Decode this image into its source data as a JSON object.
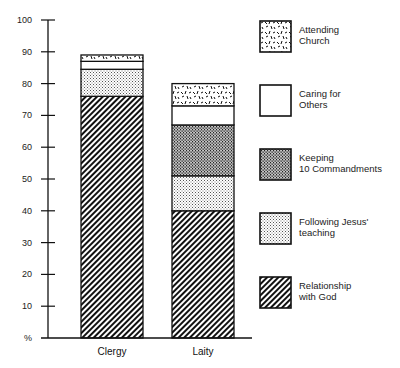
{
  "chart_data": {
    "type": "bar",
    "stacked": true,
    "title": "",
    "xlabel": "",
    "ylabel": "%",
    "ylim": [
      0,
      100
    ],
    "yticks": [
      0,
      10,
      20,
      30,
      40,
      50,
      60,
      70,
      80,
      90,
      100
    ],
    "ytick_labels": [
      "%",
      "10",
      "20",
      "30",
      "40",
      "50",
      "60",
      "70",
      "80",
      "90",
      "100"
    ],
    "grid": false,
    "legend_position": "right",
    "categories": [
      "Clergy",
      "Laity"
    ],
    "series": [
      {
        "name": "Relationship with God",
        "label_lines": [
          "Relationship",
          "with God"
        ],
        "pattern": "hatch",
        "values": [
          76,
          40
        ]
      },
      {
        "name": "Following Jesus' teaching",
        "label_lines": [
          "Following Jesus'",
          "teaching"
        ],
        "pattern": "light-dots",
        "values": [
          8.5,
          11
        ]
      },
      {
        "name": "Keeping 10 Commandments",
        "label_lines": [
          "Keeping",
          "10 Commandments"
        ],
        "pattern": "dense-dots",
        "values": [
          0,
          16
        ]
      },
      {
        "name": "Caring for Others",
        "label_lines": [
          "Caring for",
          "Others"
        ],
        "pattern": "blank",
        "values": [
          2.5,
          6
        ]
      },
      {
        "name": "Attending Church",
        "label_lines": [
          "Attending",
          "Church"
        ],
        "pattern": "dashes",
        "values": [
          2,
          7
        ]
      }
    ],
    "legend_order": [
      "Attending Church",
      "Caring for Others",
      "Keeping 10 Commandments",
      "Following Jesus' teaching",
      "Relationship with God"
    ]
  }
}
